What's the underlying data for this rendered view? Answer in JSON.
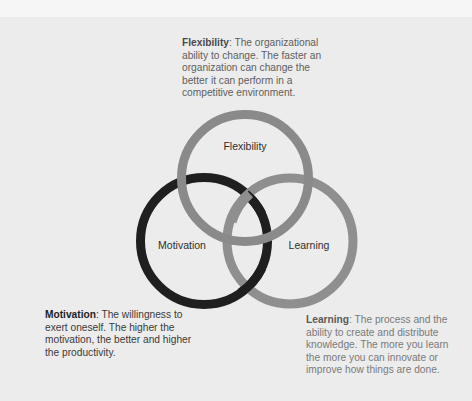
{
  "diagram": {
    "type": "venn",
    "circles": [
      {
        "id": "flexibility",
        "label": "Flexibility",
        "color": "#8a8a8a",
        "cx": 245,
        "cy": 178,
        "r": 64
      },
      {
        "id": "motivation",
        "label": "Motivation",
        "color": "#1f1f1f",
        "cx": 204,
        "cy": 241,
        "r": 64
      },
      {
        "id": "learning",
        "label": "Learning",
        "color": "#8f8f8f",
        "cx": 290,
        "cy": 241,
        "r": 63
      }
    ]
  },
  "descriptions": {
    "flexibility": {
      "term": "Flexibility",
      "text": ": The organizational ability to change. The faster an organization can change the better it can perform in a competitive environment."
    },
    "motivation": {
      "term": "Motivation",
      "text": ": The willingness to exert oneself. The higher the motivation, the better and higher the productivity."
    },
    "learning": {
      "term": "Learning",
      "text": ": The process and the ability to create and distribute knowledge. The more you learn the more you can innovate or improve how things are done."
    }
  },
  "colors": {
    "background": "#ececec",
    "motivation_ring": "#1f1f1f",
    "flexibility_ring": "#8a8a8a",
    "learning_ring": "#8f8f8f"
  }
}
